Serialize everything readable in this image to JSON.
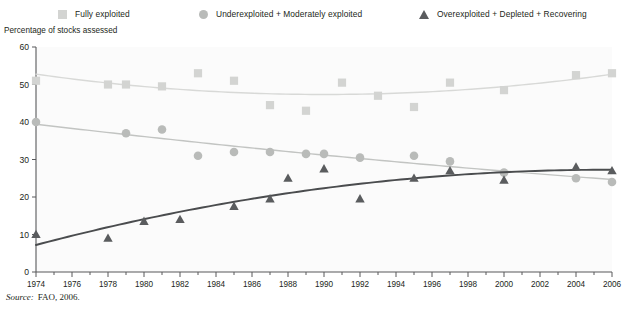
{
  "axis_title": "Percentage of stocks assessed",
  "source": {
    "label": "Source:",
    "text": "FAO, 2006."
  },
  "legend": [
    {
      "label": "Fully exploited",
      "marker": "square-marker-icon",
      "color": "#d3d4d2"
    },
    {
      "label": "Underexploited + Moderately exploited",
      "marker": "circle-marker-icon",
      "color": "#b9bbb9"
    },
    {
      "label": "Overexploited + Depleted + Recovering",
      "marker": "triangle-marker-icon",
      "color": "#5a5c5e"
    }
  ],
  "chart_data": {
    "type": "scatter",
    "title": "",
    "subtitle": "",
    "xlabel": "",
    "ylabel": "Percentage of stocks assessed",
    "xlim": [
      1974,
      2006
    ],
    "ylim": [
      0,
      60
    ],
    "xticks": [
      1974,
      1976,
      1978,
      1980,
      1982,
      1984,
      1986,
      1988,
      1990,
      1992,
      1994,
      1996,
      1998,
      2000,
      2002,
      2004,
      2006
    ],
    "yticks": [
      0,
      10,
      20,
      30,
      40,
      50,
      60
    ],
    "grid": false,
    "legend_position": "top",
    "annotations": [
      "Source: FAO, 2006."
    ],
    "series": [
      {
        "name": "Fully exploited",
        "marker": "square",
        "color": "#d3d4d2",
        "trend_color": "#d8d9d7",
        "x": [
          1974,
          1978,
          1979,
          1981,
          1983,
          1985,
          1987,
          1989,
          1991,
          1993,
          1995,
          1997,
          2000,
          2004,
          2006
        ],
        "values": [
          51,
          50,
          50,
          49.5,
          53,
          51,
          44.5,
          43,
          50.5,
          47,
          44,
          50.5,
          48.5,
          52.5,
          53
        ]
      },
      {
        "name": "Underexploited + Moderately exploited",
        "marker": "circle",
        "color": "#b9bbb9",
        "trend_color": "#c2c4c2",
        "x": [
          1974,
          1979,
          1981,
          1983,
          1985,
          1987,
          1989,
          1990,
          1992,
          1995,
          1997,
          2000,
          2004,
          2006
        ],
        "values": [
          40,
          37,
          38,
          31,
          32,
          32,
          31.5,
          31.5,
          30.5,
          31,
          29.5,
          26.5,
          25,
          24
        ]
      },
      {
        "name": "Overexploited + Depleted + Recovering",
        "marker": "triangle",
        "color": "#5a5c5e",
        "trend_color": "#4a4c4e",
        "x": [
          1974,
          1978,
          1980,
          1982,
          1985,
          1987,
          1988,
          1990,
          1992,
          1995,
          1997,
          2000,
          2004,
          2006
        ],
        "values": [
          10,
          9,
          13.5,
          14,
          17.5,
          19.5,
          25,
          27.5,
          19.5,
          25,
          27,
          24.5,
          28,
          27
        ]
      }
    ]
  }
}
